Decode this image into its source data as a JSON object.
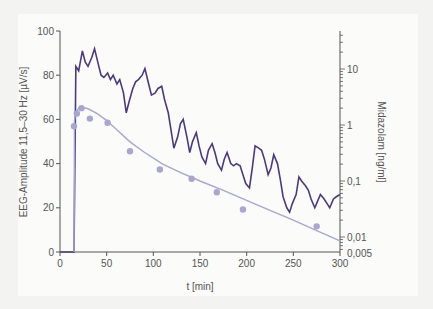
{
  "chart_data": {
    "type": "line",
    "title": "",
    "xlabel": "t [min]",
    "ylabel": "EEG-Amplitude 11,5–30 Hz [µV/s]",
    "y2label": "Midazolam [ng/ml]",
    "xlim": [
      0,
      300
    ],
    "ylim": [
      0,
      100
    ],
    "y2lim_log": [
      0.005,
      50
    ],
    "x_ticks": [
      0,
      50,
      100,
      150,
      200,
      250,
      300
    ],
    "y_ticks": [
      0,
      20,
      40,
      60,
      80,
      100
    ],
    "y2_ticks": [
      "10",
      "1",
      "0,1",
      "0,01",
      "0,005"
    ],
    "grid": false,
    "colors": {
      "eeg": "#4b3a7e",
      "midazolam": "#a9a6cf"
    },
    "series": [
      {
        "name": "EEG amplitude",
        "axis": "left",
        "style": "line",
        "x": [
          0,
          15,
          15,
          17,
          20,
          24,
          27,
          30,
          34,
          37,
          41,
          44,
          47,
          51,
          54,
          57,
          61,
          64,
          68,
          71,
          74,
          78,
          81,
          84,
          88,
          91,
          95,
          98,
          102,
          105,
          109,
          112,
          116,
          119,
          122,
          126,
          129,
          132,
          136,
          139,
          142,
          146,
          149,
          152,
          156,
          159,
          163,
          166,
          169,
          173,
          176,
          179,
          183,
          186,
          189,
          193,
          196,
          199,
          203,
          206,
          209,
          213,
          216,
          219,
          223,
          226,
          229,
          233,
          236,
          239,
          243,
          246,
          249,
          253,
          256,
          259,
          263,
          266,
          269,
          273,
          276,
          279,
          283,
          286,
          289,
          293,
          296,
          300
        ],
        "values": [
          0,
          0,
          0,
          84,
          82,
          91,
          86,
          84,
          88,
          92,
          85,
          80,
          79,
          81,
          78,
          80,
          76,
          78,
          72,
          63,
          68,
          74,
          77,
          78,
          80,
          83,
          76,
          71,
          72,
          74,
          75,
          69,
          63,
          55,
          47,
          52,
          58,
          60,
          52,
          45,
          50,
          54,
          48,
          43,
          40,
          46,
          49,
          45,
          40,
          37,
          42,
          45,
          40,
          39,
          40,
          39,
          35,
          31,
          29,
          38,
          48,
          47,
          46,
          42,
          35,
          38,
          44,
          40,
          33,
          25,
          20,
          18,
          22,
          26,
          34,
          32,
          30,
          28,
          24,
          20,
          23,
          26,
          24,
          22,
          20,
          24,
          25,
          26
        ]
      },
      {
        "name": "Midazolam concentration (measured)",
        "axis": "right",
        "style": "markers",
        "x": [
          15,
          18,
          23,
          32,
          51,
          75,
          107,
          141,
          168,
          196,
          275
        ],
        "values": [
          0.95,
          1.6,
          2.0,
          1.3,
          1.1,
          0.34,
          0.16,
          0.11,
          0.063,
          0.031,
          0.0155
        ]
      },
      {
        "name": "Midazolam concentration (model fit)",
        "axis": "right",
        "style": "line",
        "x": [
          15,
          15.5,
          17,
          20,
          25,
          30,
          40,
          50,
          60,
          75,
          90,
          110,
          130,
          150,
          175,
          200,
          225,
          250,
          275,
          300
        ],
        "values": [
          0.0001,
          1.2,
          1.7,
          2.0,
          2.05,
          1.95,
          1.6,
          1.2,
          0.85,
          0.5,
          0.33,
          0.2,
          0.14,
          0.1,
          0.068,
          0.045,
          0.03,
          0.02,
          0.013,
          0.0085
        ]
      }
    ]
  }
}
